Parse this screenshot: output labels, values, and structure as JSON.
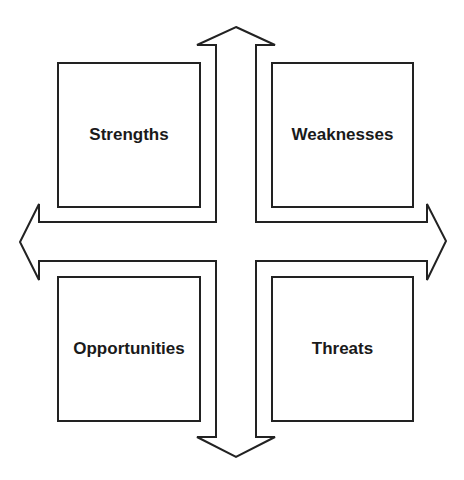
{
  "diagram": {
    "type": "SWOT analysis",
    "quadrants": [
      {
        "id": "strengths",
        "label": "Strengths"
      },
      {
        "id": "weaknesses",
        "label": "Weaknesses"
      },
      {
        "id": "opportunities",
        "label": "Opportunities"
      },
      {
        "id": "threats",
        "label": "Threats"
      }
    ],
    "arrows": [
      "up",
      "down",
      "left",
      "right"
    ],
    "colors": {
      "stroke": "#222222",
      "fill": "#ffffff",
      "text": "#1a1a1a"
    }
  }
}
